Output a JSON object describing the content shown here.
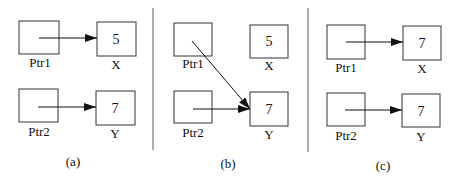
{
  "panels": [
    {
      "caption": "(a)",
      "ptr1": {
        "label": "Ptr1",
        "points_to": "X"
      },
      "ptr2": {
        "label": "Ptr2",
        "points_to": "Y"
      },
      "x": {
        "label": "X",
        "value": "5"
      },
      "y": {
        "label": "Y",
        "value": "7"
      }
    },
    {
      "caption": "(b)",
      "ptr1": {
        "label": "Ptr1",
        "points_to": "Y"
      },
      "ptr2": {
        "label": "Ptr2",
        "points_to": "Y"
      },
      "x": {
        "label": "X",
        "value": "5"
      },
      "y": {
        "label": "Y",
        "value": "7"
      }
    },
    {
      "caption": "(c)",
      "ptr1": {
        "label": "Ptr1",
        "points_to": "X"
      },
      "ptr2": {
        "label": "Ptr2",
        "points_to": "Y"
      },
      "x": {
        "label": "X",
        "value": "7"
      },
      "y": {
        "label": "Y",
        "value": "7"
      }
    }
  ],
  "colors": {
    "stroke": "#333333",
    "divider": "#777777",
    "background": "#ffffff"
  }
}
